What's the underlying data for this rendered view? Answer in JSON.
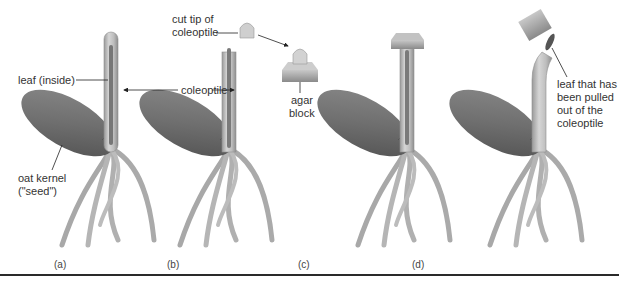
{
  "figure": {
    "panels": [
      {
        "id": "a",
        "caption": "(a)"
      },
      {
        "id": "b",
        "caption": "(b)"
      },
      {
        "id": "c",
        "caption": "(c)"
      },
      {
        "id": "d",
        "caption": "(d)"
      }
    ],
    "labels": {
      "leaf_inside": "leaf (inside)",
      "coleoptile": "coleoptile",
      "cut_tip_line1": "cut tip of",
      "cut_tip_line2": "coleoptile",
      "agar_line1": "agar",
      "agar_line2": "block",
      "kernel_line1": "oat kernel",
      "kernel_line2": "(\"seed\")",
      "leaf_pulled_line1": "leaf that has",
      "leaf_pulled_line2": "been pulled",
      "leaf_pulled_line3": "out of the",
      "leaf_pulled_line4": "coleoptile"
    },
    "colors": {
      "seed_dark": "#5e5e5e",
      "seed_light": "#9a9a9a",
      "stem": "#c4c4c4",
      "stem_edge": "#8f8f8f",
      "leaf": "#777777",
      "agar_top": "#bdbdbd",
      "agar_side": "#8c8c8c",
      "text": "#333333",
      "rule": "#2a2a2a"
    }
  }
}
